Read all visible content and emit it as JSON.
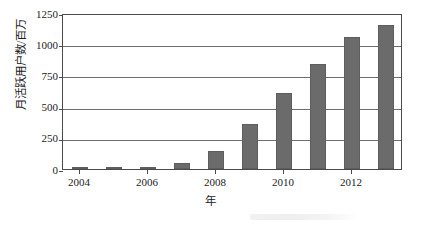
{
  "chart_data": {
    "type": "bar",
    "title": "",
    "subtitle": "",
    "xlabel": "年",
    "ylabel": "月活跃用户数/百万",
    "categories": [
      "2004",
      "2005",
      "2006",
      "2007",
      "2008",
      "2009",
      "2010",
      "2011",
      "2012",
      "2013"
    ],
    "values": [
      1,
      6,
      12,
      50,
      145,
      360,
      608,
      845,
      1056,
      1155
    ],
    "x_tick_labels": [
      "2004",
      "2006",
      "2008",
      "2010",
      "2012"
    ],
    "x_tick_values": [
      2004,
      2006,
      2008,
      2010,
      2012
    ],
    "y_tick_labels": [
      "0",
      "250",
      "500",
      "750",
      "1000",
      "1250"
    ],
    "y_tick_values": [
      0,
      250,
      500,
      750,
      1000,
      1250
    ],
    "ylim": [
      0,
      1250
    ],
    "xlim": [
      2003.5,
      2013.5
    ],
    "grid": true,
    "grid_axis": "both",
    "legend": false,
    "legend_position": "none",
    "bar_color": "#6b6b6b",
    "axis_color": "#4a4a4a",
    "grid_color": "#6e6e6e",
    "background_color": "#ffffff",
    "annotations": []
  }
}
